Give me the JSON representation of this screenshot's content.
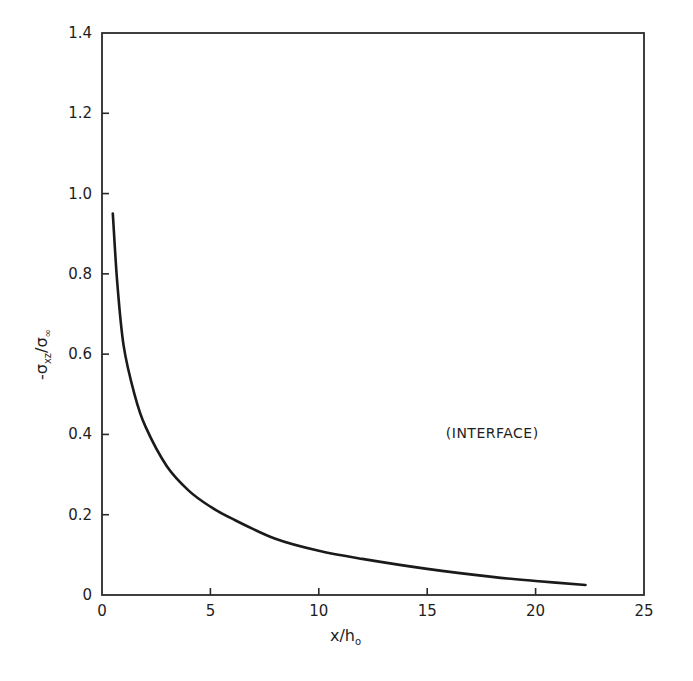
{
  "chart_data": {
    "type": "line",
    "title": "",
    "xlabel": "x/h₀",
    "ylabel": "-σxz/σ∞",
    "xlim": [
      0,
      25
    ],
    "ylim": [
      0,
      1.4
    ],
    "x_ticks": [
      "0",
      "5",
      "10",
      "15",
      "20",
      "25"
    ],
    "y_ticks": [
      "0",
      "0.2",
      "0.4",
      "0.6",
      "0.8",
      "1.0",
      "1.2",
      "1.4"
    ],
    "grid": false,
    "legend": null,
    "annotations": [
      {
        "text": "(INTERFACE)",
        "x": 18.0,
        "y": 0.39
      }
    ],
    "series": [
      {
        "name": "interface shear stress",
        "x": [
          0.5,
          0.7,
          1.0,
          1.5,
          2.0,
          3.0,
          4.0,
          5.0,
          6.0,
          8.0,
          10.0,
          12.0,
          15.0,
          18.0,
          20.0,
          22.3
        ],
        "y": [
          0.95,
          0.78,
          0.62,
          0.5,
          0.42,
          0.32,
          0.26,
          0.22,
          0.19,
          0.14,
          0.11,
          0.09,
          0.065,
          0.045,
          0.035,
          0.025
        ]
      }
    ]
  },
  "axes": {
    "x_label_main": "x/h",
    "x_label_sub": "o",
    "y_label_prefix": "-σ",
    "y_label_sub": "xz",
    "y_label_div": "/σ",
    "y_label_sub2": "∞"
  },
  "colors": {
    "line": "#1a1a1a",
    "frame": "#2a2a2a",
    "background": "#ffffff"
  }
}
